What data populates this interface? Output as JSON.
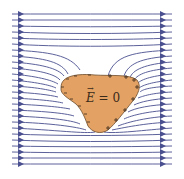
{
  "diagram": {
    "label": "E = 0",
    "label_vector_symbol": "E",
    "label_value": "= 0",
    "conductor_color": "#e3a264",
    "line_color": "#4a4f8f",
    "charge_sign_color": "#3a2a1a"
  }
}
